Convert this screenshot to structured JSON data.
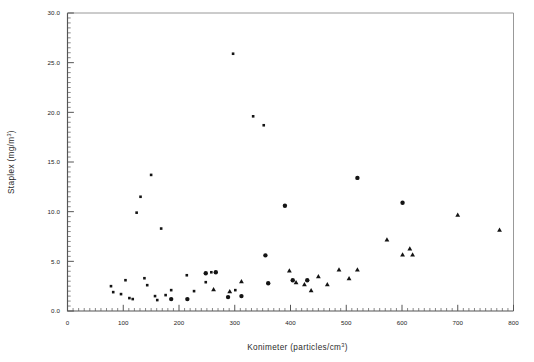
{
  "figure": {
    "kind": "scatter-plot",
    "background_color": "#ffffff",
    "frame_color": "#555555",
    "marker_color": "#141414"
  },
  "chart_data": {
    "type": "scatter",
    "title": "",
    "subtitle": "",
    "xlabel": "Konimeter (particles/cm³)",
    "xlabel_base": "Konimeter (particles/cm",
    "xlabel_exponent": "3",
    "xlabel_tail": ")",
    "ylabel": "Staplex (mg/m³)",
    "ylabel_base": "Staplex (mg/m",
    "ylabel_exponent": "3",
    "ylabel_tail": ")",
    "xlim": [
      0,
      800
    ],
    "ylim": [
      0.0,
      30.0
    ],
    "grid": false,
    "legend": "none",
    "xticks": [
      0,
      100,
      200,
      300,
      400,
      500,
      600,
      700,
      800
    ],
    "xtick_labels": [
      "0",
      "100",
      "200",
      "300",
      "400",
      "500",
      "600",
      "700",
      "800"
    ],
    "x_minor_tick_interval": 10,
    "yticks": [
      0.0,
      5.0,
      10.0,
      15.0,
      20.0,
      25.0,
      30.0
    ],
    "ytick_labels": [
      "0.0",
      "5.0",
      "10.0",
      "15.0",
      "20.0",
      "25.0",
      "30.0"
    ],
    "y_minor_tick_interval": 0.5,
    "series": [
      {
        "name": "small-square-markers",
        "marker": "square",
        "marker_size": 2.6,
        "color": "#141414",
        "points": [
          [
            78,
            2.5
          ],
          [
            82,
            1.9
          ],
          [
            96,
            1.7
          ],
          [
            104,
            3.1
          ],
          [
            111,
            1.3
          ],
          [
            117,
            1.2
          ],
          [
            124,
            9.9
          ],
          [
            131,
            11.5
          ],
          [
            138,
            3.3
          ],
          [
            143,
            2.6
          ],
          [
            150,
            13.7
          ],
          [
            157,
            1.5
          ],
          [
            161,
            1.1
          ],
          [
            168,
            8.3
          ],
          [
            176,
            1.6
          ],
          [
            186,
            2.1
          ],
          [
            214,
            3.6
          ],
          [
            227,
            2.0
          ],
          [
            248,
            2.9
          ],
          [
            258,
            3.9
          ],
          [
            297,
            25.9
          ],
          [
            301,
            2.1
          ],
          [
            333,
            19.6
          ],
          [
            352,
            18.7
          ]
        ]
      },
      {
        "name": "circle-markers",
        "marker": "circle",
        "marker_size": 4.4,
        "color": "#141414",
        "points": [
          [
            186,
            1.2
          ],
          [
            215,
            1.2
          ],
          [
            248,
            3.8
          ],
          [
            266,
            3.9
          ],
          [
            288,
            1.4
          ],
          [
            312,
            1.5
          ],
          [
            355,
            5.6
          ],
          [
            360,
            2.8
          ],
          [
            390,
            10.6
          ],
          [
            404,
            3.1
          ],
          [
            430,
            3.1
          ],
          [
            520,
            13.4
          ],
          [
            601,
            10.9
          ]
        ]
      },
      {
        "name": "triangle-markers",
        "marker": "triangle",
        "marker_size": 4.8,
        "color": "#141414",
        "points": [
          [
            262,
            2.2
          ],
          [
            291,
            2.0
          ],
          [
            312,
            3.0
          ],
          [
            398,
            4.1
          ],
          [
            410,
            2.9
          ],
          [
            425,
            2.7
          ],
          [
            437,
            2.1
          ],
          [
            450,
            3.5
          ],
          [
            466,
            2.7
          ],
          [
            487,
            4.2
          ],
          [
            505,
            3.3
          ],
          [
            520,
            4.2
          ],
          [
            573,
            7.2
          ],
          [
            601,
            5.7
          ],
          [
            614,
            6.3
          ],
          [
            619,
            5.7
          ],
          [
            700,
            9.7
          ],
          [
            775,
            8.2
          ]
        ]
      }
    ]
  }
}
